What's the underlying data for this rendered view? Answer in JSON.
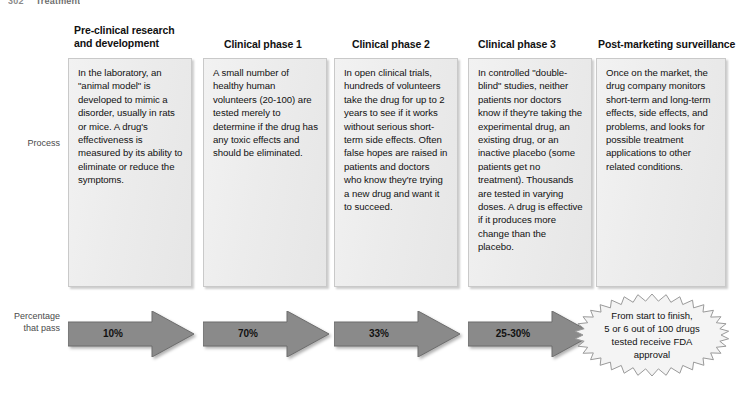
{
  "running_head": {
    "page_number": "302",
    "title": "Treatment"
  },
  "row_labels": {
    "process": "Process",
    "percentage": "Percentage\nthat pass",
    "percentage_line1": "Percentage",
    "percentage_line2": "that pass"
  },
  "columns": [
    {
      "header_line1": "Pre-clinical research",
      "header_line2": "and development",
      "body": "In the laboratory, an \"animal model\" is developed to mimic a disorder, usually in rats or mice. A drug's effectiveness is measured by its ability to eliminate or reduce the symptoms.",
      "pass_rate": "10%"
    },
    {
      "header_line1": "Clinical phase 1",
      "header_line2": "",
      "body": "A small number of healthy human volunteers (20-100) are tested merely to determine if  the drug has any toxic effects and should be eliminated.",
      "pass_rate": "70%"
    },
    {
      "header_line1": "Clinical phase 2",
      "header_line2": "",
      "body": "In open clinical trials, hundreds of volunteers take the drug for up to 2 years to see if it works without serious short-term side effects. Often false hopes are raised in patients and doctors who know they're trying a new drug and want it to succeed.",
      "pass_rate": "33%"
    },
    {
      "header_line1": "Clinical phase 3",
      "header_line2": "",
      "body": "In controlled \"double-blind\" studies, neither patients nor doctors know if they're taking the experimental drug, an existing drug, or an inactive placebo (some patients get no treatment). Thousands are tested in varying doses. A drug is effective if it produces more change than the placebo.",
      "pass_rate": "25-30%"
    },
    {
      "header_line1": "Post-marketing surveillance",
      "header_line2": "",
      "body": "Once on the market, the drug company monitors short-term and long-term effects, side effects, and problems, and looks for possible treatment applications to other related conditions.",
      "pass_rate": ""
    }
  ],
  "outcome_badge": {
    "line1": "From start to finish,",
    "line2": "5 or 6 out of 100 drugs",
    "line3": "tested receive FDA",
    "line4": "approval"
  },
  "colors": {
    "box_fill": "#ececec",
    "box_border": "#c9c9c9",
    "arrow_fill": "#8a8a8a",
    "arrow_stroke": "#6d6d6d",
    "text": "#111111",
    "label_text": "#4a4a4a",
    "background": "#ffffff"
  }
}
